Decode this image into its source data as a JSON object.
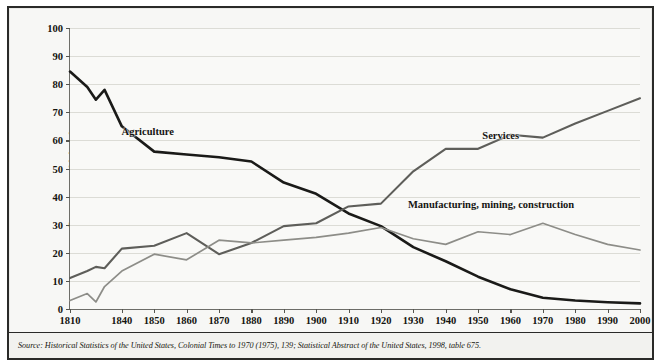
{
  "chart_data": {
    "type": "line",
    "title": "",
    "xlabel": "",
    "ylabel": "Percentage of labor force",
    "ylim": [
      0,
      100
    ],
    "ytick_step": 10,
    "yticks": [
      0,
      10,
      20,
      30,
      40,
      50,
      60,
      70,
      80,
      90,
      100
    ],
    "xlim": [
      1810,
      2000
    ],
    "xticks": [
      1810,
      1840,
      1850,
      1860,
      1870,
      1880,
      1890,
      1900,
      1910,
      1920,
      1930,
      1940,
      1950,
      1960,
      1970,
      1980,
      1990,
      2000
    ],
    "xtick_labels": [
      "1810",
      "1840",
      "1850",
      "1860",
      "1870",
      "1880",
      "1890",
      "1900",
      "1910",
      "1920",
      "1930",
      "1940",
      "1950",
      "1960",
      "1970",
      "1980",
      "1990",
      "2000"
    ],
    "grid": true,
    "grid_axis": "y",
    "legend_position": "inline-annotations",
    "series": [
      {
        "name": "Agriculture",
        "color": "#1a1a18",
        "x": [
          1810,
          1820,
          1825,
          1830,
          1840,
          1850,
          1860,
          1870,
          1880,
          1890,
          1900,
          1910,
          1920,
          1930,
          1940,
          1950,
          1960,
          1970,
          1980,
          1990,
          2000
        ],
        "values": [
          84.5,
          79.0,
          74.5,
          78.0,
          65.0,
          56.0,
          55.0,
          54.0,
          52.5,
          45.0,
          41.0,
          34.0,
          29.5,
          22.0,
          17.0,
          11.5,
          7.0,
          4.0,
          3.0,
          2.4,
          2.0
        ]
      },
      {
        "name": "Services",
        "color": "#5e5e5a",
        "x": [
          1810,
          1820,
          1825,
          1830,
          1840,
          1850,
          1860,
          1870,
          1880,
          1890,
          1900,
          1910,
          1920,
          1930,
          1940,
          1950,
          1960,
          1970,
          1980,
          1990,
          2000
        ],
        "values": [
          11.0,
          13.5,
          15.0,
          14.5,
          21.5,
          22.5,
          27.0,
          19.5,
          23.5,
          29.5,
          30.5,
          36.5,
          37.5,
          49.0,
          57.0,
          57.0,
          62.0,
          61.0,
          66.0,
          70.5,
          75.0
        ]
      },
      {
        "name": "Manufacturing, mining, construction",
        "color": "#8d8d88",
        "x": [
          1810,
          1820,
          1825,
          1830,
          1840,
          1850,
          1860,
          1870,
          1880,
          1890,
          1900,
          1910,
          1920,
          1930,
          1940,
          1950,
          1960,
          1970,
          1980,
          1990,
          2000
        ],
        "values": [
          3.0,
          5.5,
          2.5,
          8.0,
          13.5,
          19.5,
          17.5,
          24.5,
          23.5,
          24.5,
          25.5,
          27.0,
          29.0,
          25.0,
          23.0,
          27.5,
          26.5,
          30.5,
          26.5,
          23.0,
          21.0
        ]
      }
    ],
    "annotations": [
      {
        "text": "Agriculture",
        "x": 1848,
        "y": 63.5
      },
      {
        "text": "Services",
        "x": 1957,
        "y": 62.0
      },
      {
        "text": "Manufacturing, mining, construction",
        "x": 1954,
        "y": 37.5
      }
    ]
  },
  "source": {
    "prefix": "Source: ",
    "text": "Historical Statistics of the United States, Colonial Times to 1970 (1975), 139; Statistical Abstract of the United States, 1998, table 675."
  }
}
